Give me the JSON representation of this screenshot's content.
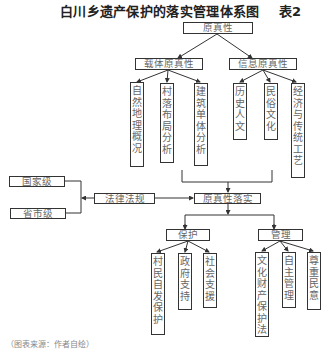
{
  "header": {
    "title": "白川乡遗产保护的落实管理体系图",
    "table_label": "表2"
  },
  "diagram": {
    "root": "原真性",
    "carrier": {
      "label": "载体原真性",
      "children": [
        "自然地理概况",
        "村落布局分析",
        "建筑单体分析"
      ]
    },
    "information": {
      "label": "信息原真性",
      "children": [
        "历史人文",
        "民俗文化",
        "经济与传统工艺"
      ]
    },
    "implementation": "原真性落实",
    "law": {
      "label": "法律法规",
      "levels": [
        "国家级",
        "省市级"
      ]
    },
    "protection": {
      "label": "保护",
      "children": [
        "村民自发保护",
        "政府支持",
        "社会支援"
      ]
    },
    "management": {
      "label": "管理",
      "children": [
        "文化财产保护法",
        "自主管理",
        "尊重民意"
      ]
    }
  },
  "footer": {
    "text": "（图表来源：作者自绘）"
  }
}
